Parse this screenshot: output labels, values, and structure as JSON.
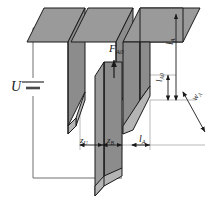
{
  "figure": {
    "colors": {
      "plate_top_fill": "#9a9a9a",
      "plate_side_fill": "#8c8c8c",
      "plate_edge_fill": "#b4b4b4",
      "outline": "#1a1a1a",
      "wire": "#6f6f6f",
      "dimension_line": "#6f6f6f"
    }
  },
  "labels": {
    "voltage": {
      "symbol": "U",
      "subscript": ""
    },
    "force": {
      "symbol": "F",
      "subscript": "A0"
    },
    "length_a_right": {
      "symbol": "l",
      "subscript": "A"
    },
    "length_a0": {
      "symbol": "l",
      "subscript": "A0"
    },
    "width_a": {
      "symbol": "w",
      "subscript": "A"
    },
    "gap_u": {
      "symbol": "z",
      "subscript": "U"
    },
    "gap_b": {
      "symbol": "z",
      "subscript": "B"
    },
    "length_a_bottom": {
      "symbol": "l",
      "subscript": "A"
    }
  },
  "components": {
    "voltage_source": "battery-symbol",
    "fixed_electrodes": 3,
    "movable_electrode": 1,
    "force_arrow_direction": "up",
    "circuit": "closed-loop"
  }
}
